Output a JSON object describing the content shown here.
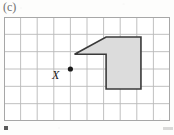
{
  "figure": {
    "part_label": "(c)",
    "background_color": "#fdfdfc"
  },
  "grid": {
    "columns": 10,
    "rows": 6,
    "cell_size_px": 16.6,
    "origin_x_px": 4,
    "origin_y_px": 17,
    "line_color": "#b8b8b8",
    "border_color": "#a9a9a9",
    "visible": true
  },
  "point_x": {
    "label": "X",
    "grid_col": 4,
    "grid_row": 3,
    "pixel_x": 74.4,
    "pixel_y": 67.8,
    "dot_color": "#1a1a1a",
    "dot_radius_px": 2.6,
    "label_offset_x_px": -11,
    "label_offset_y_px": 4
  },
  "shape": {
    "name": "notched-quadrilateral",
    "fill_color": "#dcdcdc",
    "stroke_color": "#3a3a3a",
    "stroke_width_px": 1.6,
    "vertices_grid": [
      [
        6.15,
        1.15
      ],
      [
        8.25,
        1.15
      ],
      [
        8.25,
        4.15
      ],
      [
        6.15,
        4.15
      ],
      [
        6.15,
        2.15
      ],
      [
        4.25,
        2.15
      ]
    ],
    "vertices_px": [
      [
        106,
        36
      ],
      [
        126,
        36
      ],
      [
        126,
        70
      ],
      [
        106,
        70
      ],
      [
        106,
        52
      ],
      [
        93,
        52
      ]
    ]
  },
  "scan_marks": [
    {
      "name": "bottom-left-speck",
      "x_px": 4,
      "y_px": 126
    },
    {
      "name": "bottom-right-speck",
      "x_px": 163,
      "y_px": 127
    }
  ]
}
